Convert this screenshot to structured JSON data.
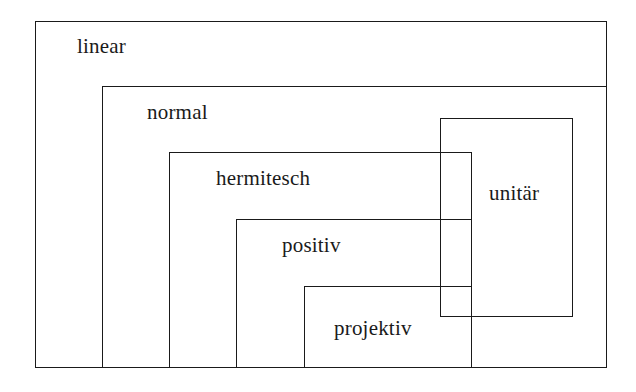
{
  "diagram": {
    "type": "nested-set-diagram",
    "stroke_color": "#1a1a1a",
    "background_color": "#ffffff",
    "regions": [
      {
        "id": "linear",
        "label": "linear",
        "x": 35,
        "y": 21,
        "width": 572,
        "height": 347,
        "overlapping": false
      },
      {
        "id": "normal",
        "label": "normal",
        "x": 102,
        "y": 86,
        "width": 505,
        "height": 282,
        "overlapping": false
      },
      {
        "id": "hermitesch",
        "label": "hermitesch",
        "x": 169,
        "y": 152,
        "width": 303,
        "height": 216,
        "overlapping": false
      },
      {
        "id": "positiv",
        "label": "positiv",
        "x": 236,
        "y": 219,
        "width": 236,
        "height": 149,
        "overlapping": false
      },
      {
        "id": "projektiv",
        "label": "projektiv",
        "x": 304,
        "y": 286,
        "width": 168,
        "height": 82,
        "overlapping": false
      },
      {
        "id": "unitaer",
        "label": "unitär",
        "x": 440,
        "y": 118,
        "width": 133,
        "height": 199,
        "overlapping": true
      }
    ]
  }
}
